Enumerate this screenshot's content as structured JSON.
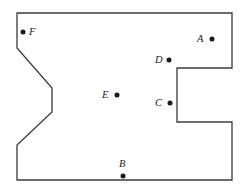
{
  "figure": {
    "type": "geometric-region-diagram",
    "width": 249,
    "height": 196,
    "background_color": "#ffffff",
    "outline_color": "#3b3b3b",
    "dot_color": "#1a1a1a",
    "polygon_points": "17,13 232,13 232,68 177,68 177,122 232,122 232,180 17,180 17,145 52,112 52,88 17,48",
    "vertices": [
      {
        "x": 17,
        "y": 13
      },
      {
        "x": 232,
        "y": 13
      },
      {
        "x": 232,
        "y": 68
      },
      {
        "x": 177,
        "y": 68
      },
      {
        "x": 177,
        "y": 122
      },
      {
        "x": 232,
        "y": 122
      },
      {
        "x": 232,
        "y": 180
      },
      {
        "x": 17,
        "y": 180
      },
      {
        "x": 17,
        "y": 145
      },
      {
        "x": 52,
        "y": 112
      },
      {
        "x": 52,
        "y": 88
      },
      {
        "x": 17,
        "y": 48
      }
    ],
    "points": [
      {
        "id": "A",
        "label": "A",
        "x": 212,
        "y": 39,
        "label_x": 197,
        "label_y": 34,
        "dot_radius": 2.5
      },
      {
        "id": "B",
        "label": "B",
        "x": 123,
        "y": 176,
        "label_x": 119,
        "label_y": 159,
        "dot_radius": 2.5
      },
      {
        "id": "C",
        "label": "C",
        "x": 170,
        "y": 103,
        "label_x": 155,
        "label_y": 98,
        "dot_radius": 2.5
      },
      {
        "id": "D",
        "label": "D",
        "x": 169,
        "y": 60,
        "label_x": 155,
        "label_y": 55,
        "dot_radius": 2.5
      },
      {
        "id": "E",
        "label": "E",
        "x": 117,
        "y": 95,
        "label_x": 102,
        "label_y": 90,
        "dot_radius": 2.5
      },
      {
        "id": "F",
        "label": "F",
        "x": 23,
        "y": 32,
        "label_x": 29,
        "label_y": 27,
        "dot_radius": 2.5
      }
    ]
  }
}
